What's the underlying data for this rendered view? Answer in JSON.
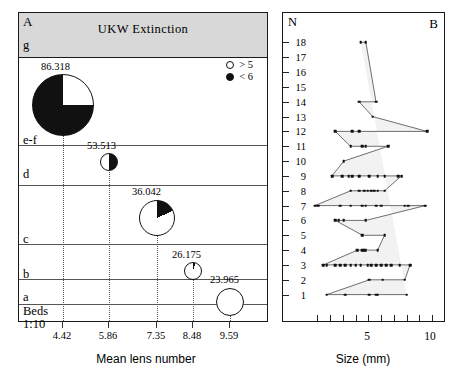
{
  "figure": {
    "panel_a": {
      "label": "A",
      "header_title": "UKW  Extinction",
      "top_bed_label": "g",
      "bed_labels": [
        "e-f",
        "d",
        "c",
        "b",
        "a"
      ],
      "beds_scale_label_line1": "Beds",
      "beds_scale_label_line2": "1:10",
      "x_axis_title": "Mean lens number",
      "x_ticks": [
        "4.42",
        "5.86",
        "7.35",
        "8.48",
        "9.59"
      ],
      "legend": [
        {
          "symbol": "open-circle",
          "label": "> 5"
        },
        {
          "symbol": "filled-circle",
          "label": "< 6"
        }
      ],
      "pies": [
        {
          "value": "86.318",
          "x_tick": "4.42",
          "radius_px": 31,
          "black_fraction": 0.75,
          "start_deg": 0
        },
        {
          "value": "53.513",
          "x_tick": "5.86",
          "radius_px": 9,
          "black_fraction": 0.5,
          "start_deg": 0
        },
        {
          "value": "36.042",
          "x_tick": "7.35",
          "radius_px": 18,
          "black_fraction": 0.18,
          "start_deg": 0
        },
        {
          "value": "26.175",
          "x_tick": "8.48",
          "radius_px": 9,
          "black_fraction": 0.05,
          "start_deg": 0
        },
        {
          "value": "23.965",
          "x_tick": "9.59",
          "radius_px": 14,
          "black_fraction": 0.0,
          "start_deg": 0
        }
      ]
    },
    "panel_b": {
      "label": "B",
      "y_axis_title": "N",
      "x_axis_title": "Size (mm)",
      "y_ticks": [
        1,
        2,
        3,
        4,
        5,
        6,
        7,
        8,
        9,
        10,
        11,
        12,
        13,
        14,
        15,
        16,
        17,
        18
      ],
      "x_labeled_ticks": [
        5,
        10
      ],
      "x_minor_tick_count": 9
    }
  },
  "chart_data": [
    {
      "type": "pie",
      "title": "UKW  Extinction",
      "xlabel": "Mean lens number",
      "ylabel": "Beds",
      "categories": [
        "a",
        "b",
        "c",
        "d",
        "e-f"
      ],
      "x": [
        9.59,
        8.48,
        7.35,
        5.86,
        4.42
      ],
      "values": [
        23.965,
        26.175,
        36.042,
        53.513,
        86.318
      ],
      "slice_black_fraction": [
        0.0,
        0.05,
        0.18,
        0.5,
        0.75
      ],
      "legend": [
        "> 5",
        "< 6"
      ],
      "xlim": [
        3.8,
        10.2
      ],
      "grid": false,
      "legend_position": "top-right",
      "note": "Marker area scales with value; black sector indicates proportion < 6"
    },
    {
      "type": "scatter",
      "title": "B",
      "xlabel": "Size (mm)",
      "ylabel": "N",
      "xlim": [
        3.0,
        10.6
      ],
      "ylim": [
        0.5,
        18.5
      ],
      "grid": false,
      "series": [
        {
          "name": "N=18",
          "y": 18,
          "x": [
            6.05,
            6.35
          ]
        },
        {
          "name": "N=14",
          "y": 14,
          "x": [
            5.95,
            6.95
          ]
        },
        {
          "name": "N=13",
          "y": 13,
          "x": [
            6.75
          ]
        },
        {
          "name": "N=12",
          "y": 12,
          "x": [
            4.55,
            5.55,
            5.95,
            9.95
          ]
        },
        {
          "name": "N=11",
          "y": 11,
          "x": [
            5.45,
            6.15,
            6.35,
            7.65
          ]
        },
        {
          "name": "N=10",
          "y": 10,
          "x": [
            5.05
          ]
        },
        {
          "name": "N=9",
          "y": 9,
          "x": [
            4.35,
            4.95,
            5.35,
            5.55,
            5.95,
            6.55,
            7.05,
            7.45,
            8.25,
            8.45
          ]
        },
        {
          "name": "N=8",
          "y": 8,
          "x": [
            5.45,
            5.95,
            6.25,
            6.45,
            6.65,
            6.85,
            7.05,
            7.45
          ]
        },
        {
          "name": "N=7",
          "y": 7,
          "x": [
            3.35,
            3.55,
            4.85,
            5.45,
            6.15,
            6.35,
            6.95,
            7.25,
            8.65,
            8.85,
            9.85
          ]
        },
        {
          "name": "N=6",
          "y": 6,
          "x": [
            4.55,
            4.75,
            5.05,
            6.35
          ]
        },
        {
          "name": "N=5",
          "y": 5,
          "x": [
            6.15,
            7.45
          ]
        },
        {
          "name": "N=4",
          "y": 4,
          "x": [
            5.85,
            6.15,
            6.25,
            6.35,
            7.05
          ]
        },
        {
          "name": "N=3",
          "y": 3,
          "x": [
            3.85,
            4.05,
            4.55,
            4.85,
            5.15,
            5.45,
            5.75,
            6.05,
            6.45,
            6.65,
            6.95,
            7.25,
            7.55,
            7.85,
            8.35,
            8.95
          ]
        },
        {
          "name": "N=2",
          "y": 2,
          "x": [
            6.55,
            7.35,
            8.65
          ]
        },
        {
          "name": "N=1",
          "y": 1,
          "x": [
            4.05,
            5.15,
            6.55,
            6.95,
            7.05,
            8.75
          ]
        }
      ],
      "polyline_note": "Points at each N level connected vertex-to-vertex forming a zigzag envelope"
    }
  ]
}
